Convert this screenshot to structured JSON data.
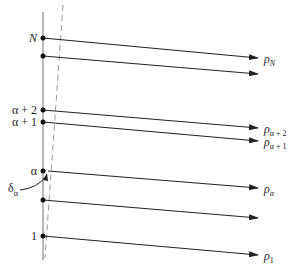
{
  "diagram": {
    "left_labels": {
      "N": "N",
      "alpha_plus_2": "α + 2",
      "alpha_plus_1": "α + 1",
      "alpha": "α",
      "one": "1"
    },
    "right_labels": {
      "rho_N": {
        "base": "ρ",
        "sub": "N"
      },
      "rho_alpha_plus_2": {
        "base": "ρ",
        "sub": "α + 2"
      },
      "rho_alpha_plus_1": {
        "base": "ρ",
        "sub": "α + 1"
      },
      "rho_alpha": {
        "base": "ρ",
        "sub": "α"
      },
      "rho_1": {
        "base": "ρ",
        "sub": "1"
      }
    },
    "annotation": {
      "base": "δ",
      "sub": "α"
    },
    "colors": {
      "line": "#222222",
      "axis": "#888888",
      "dashed": "#999999"
    }
  }
}
